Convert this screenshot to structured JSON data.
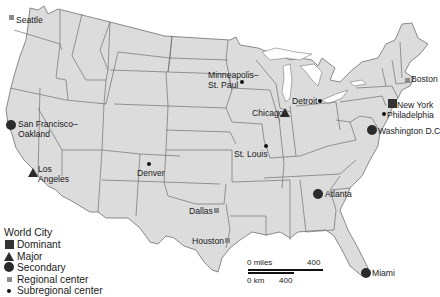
{
  "map": {
    "colors": {
      "land": "#dcdcdc",
      "border": "#6e6e6e",
      "symbol": "#2b2b2b",
      "regional": "#8c8c8c",
      "background": "#ffffff"
    },
    "cities": [
      {
        "name": "Seattle",
        "label": "Seattle",
        "type": "regional",
        "x": 11,
        "y": 17,
        "lx": 16,
        "ly": 15
      },
      {
        "name": "San Francisco-Oakland",
        "label": "San Francisco–",
        "label2": "Oakland",
        "type": "secondary",
        "x": 11,
        "y": 125,
        "lx": 18,
        "ly": 119
      },
      {
        "name": "Los Angeles",
        "label": "Los",
        "label2": "Angeles",
        "type": "major",
        "x": 33,
        "y": 172,
        "lx": 38,
        "ly": 164
      },
      {
        "name": "Denver",
        "label": "Denver",
        "type": "subregional",
        "x": 149,
        "y": 164,
        "lx": 137,
        "ly": 168
      },
      {
        "name": "Minneapolis-St. Paul",
        "label": "Minneapolis–",
        "label2": "St. Paul",
        "type": "subregional",
        "x": 242,
        "y": 82,
        "lx": 208,
        "ly": 70
      },
      {
        "name": "Chicago",
        "label": "Chicago",
        "type": "major",
        "x": 285,
        "y": 112,
        "lx": 252,
        "ly": 108
      },
      {
        "name": "Detroit",
        "label": "Detroit",
        "type": "subregional",
        "x": 320,
        "y": 101,
        "lx": 292,
        "ly": 96
      },
      {
        "name": "St. Louis",
        "label": "St. Louis",
        "type": "subregional",
        "x": 266,
        "y": 146,
        "lx": 234,
        "ly": 149
      },
      {
        "name": "Boston",
        "label": "Boston",
        "type": "regional",
        "x": 407,
        "y": 80,
        "lx": 411,
        "ly": 74
      },
      {
        "name": "New York",
        "label": "New York",
        "type": "dominant",
        "x": 392,
        "y": 103,
        "lx": 397,
        "ly": 100
      },
      {
        "name": "Philadelphia",
        "label": "Philadelphia",
        "type": "subregional",
        "x": 384,
        "y": 114,
        "lx": 387,
        "ly": 110
      },
      {
        "name": "Washington D.C",
        "label": "Washington D.C",
        "type": "secondary",
        "x": 372,
        "y": 130,
        "lx": 378,
        "ly": 126
      },
      {
        "name": "Atlanta",
        "label": "Atlanta",
        "type": "secondary",
        "x": 318,
        "y": 194,
        "lx": 325,
        "ly": 189
      },
      {
        "name": "Dallas",
        "label": "Dallas",
        "type": "regional",
        "x": 216,
        "y": 210,
        "lx": 189,
        "ly": 206
      },
      {
        "name": "Houston",
        "label": "Houston",
        "type": "regional",
        "x": 227,
        "y": 240,
        "lx": 192,
        "ly": 236
      },
      {
        "name": "Miami",
        "label": "Miami",
        "type": "secondary",
        "x": 366,
        "y": 273,
        "lx": 372,
        "ly": 268
      }
    ]
  },
  "legend": {
    "title": "World City",
    "items": [
      {
        "type": "dominant",
        "label": "Dominant"
      },
      {
        "type": "major",
        "label": "Major"
      },
      {
        "type": "secondary",
        "label": "Secondary"
      },
      {
        "type": "regional",
        "label": "Regional center"
      },
      {
        "type": "subregional",
        "label": "Subregional center"
      }
    ]
  },
  "scale_bar": {
    "miles_start": "0 miles",
    "miles_end": "400",
    "km_start": "0 km",
    "km_end": "400"
  }
}
